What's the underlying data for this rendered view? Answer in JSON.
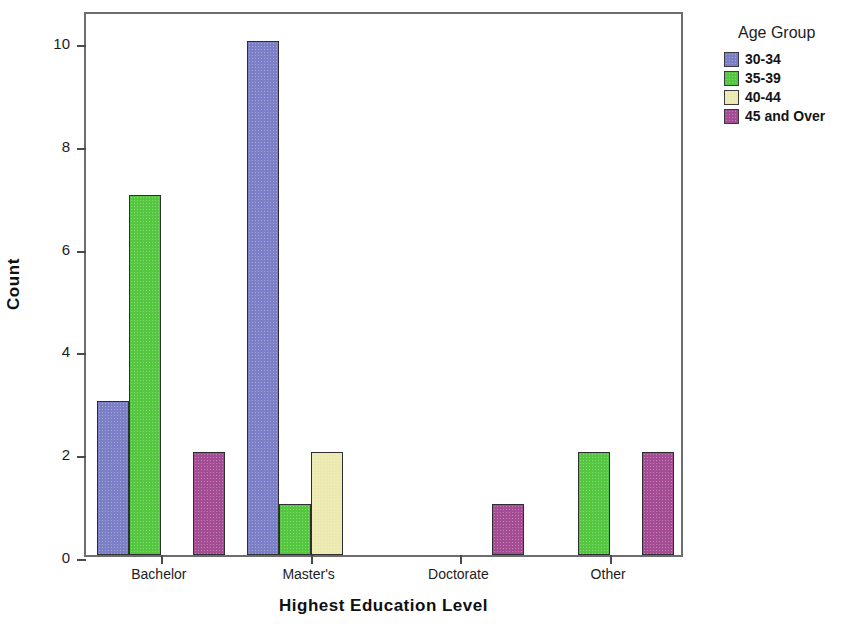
{
  "chart_data": {
    "type": "bar",
    "title": "",
    "subtitle": "",
    "xlabel": "Highest Education Level",
    "ylabel": "Count",
    "categories": [
      "Bachelor",
      "Master's",
      "Doctorate",
      "Other"
    ],
    "ytick_labels": [
      "0",
      "2",
      "4",
      "6",
      "8",
      "10"
    ],
    "ytick_values": [
      0,
      2,
      4,
      6,
      8,
      10
    ],
    "ylim": [
      0,
      10.6
    ],
    "grid": false,
    "legend_position": "right",
    "legend_title": "Age Group",
    "series": [
      {
        "name": "30-34",
        "color": "#7b80c6",
        "values": [
          3,
          10,
          0,
          0
        ]
      },
      {
        "name": "35-39",
        "color": "#55c63f",
        "values": [
          7,
          1,
          0,
          2
        ]
      },
      {
        "name": "40-44",
        "color": "#ece9b0",
        "values": [
          0,
          2,
          0,
          0
        ]
      },
      {
        "name": "45 and Over",
        "color": "#a44d94",
        "values": [
          2,
          0,
          1,
          2
        ]
      }
    ]
  },
  "axes": {
    "y_title": "Count",
    "x_title": "Highest Education Level"
  },
  "legend": {
    "title": "Age Group",
    "entries": [
      {
        "label": "30-34",
        "color": "#7b80c6"
      },
      {
        "label": "35-39",
        "color": "#55c63f"
      },
      {
        "label": "40-44",
        "color": "#ece9b0"
      },
      {
        "label": "45 and Over",
        "color": "#a44d94"
      }
    ]
  },
  "colors": {
    "frame": "#6d6d70",
    "bar_outline": "#2e2e33",
    "background": "#ffffff",
    "text": "#1c1c1e"
  }
}
